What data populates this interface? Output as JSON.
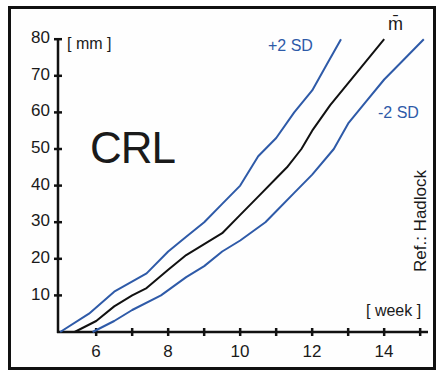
{
  "chart_data": {
    "type": "line",
    "title": "CRL",
    "xlabel": "[ week ]",
    "ylabel": "[ mm ]",
    "xlim": [
      5,
      15.2
    ],
    "ylim": [
      0,
      80
    ],
    "x_ticks": [
      6,
      8,
      10,
      12,
      14
    ],
    "x_minor_ticks": [
      7,
      9,
      11,
      13,
      15
    ],
    "y_ticks": [
      10,
      20,
      30,
      40,
      50,
      60,
      70,
      80
    ],
    "grid": false,
    "legend": "inline labels at line ends",
    "annotation": "Ref.: Hadlock",
    "series": [
      {
        "name": "+2 SD",
        "color": "#2e5aa8",
        "x": [
          5.0,
          5.8,
          6.5,
          7.4,
          8.0,
          8.5,
          9.0,
          9.5,
          10.0,
          10.5,
          11.0,
          11.5,
          12.0,
          12.4,
          12.8
        ],
        "y": [
          0,
          5,
          11,
          16,
          22,
          26,
          30,
          35,
          40,
          48,
          53,
          60,
          66,
          73,
          80
        ]
      },
      {
        "name": "m̄",
        "color": "#111111",
        "x": [
          5.4,
          6.0,
          6.5,
          7.0,
          7.4,
          8.0,
          8.5,
          9.0,
          9.5,
          10.0,
          10.5,
          11.0,
          11.3,
          11.7,
          12.0,
          12.5,
          13.0,
          13.5,
          14.0
        ],
        "y": [
          0,
          3,
          7,
          10,
          12,
          17,
          21,
          24,
          27,
          32,
          37,
          42,
          45,
          50,
          55,
          62,
          68,
          74,
          80
        ]
      },
      {
        "name": "-2 SD",
        "color": "#2e5aa8",
        "x": [
          5.9,
          6.5,
          7.0,
          7.8,
          8.5,
          9.0,
          9.5,
          10.0,
          10.7,
          11.0,
          11.5,
          12.0,
          12.6,
          13.0,
          13.5,
          14.0,
          14.5,
          15.1
        ],
        "y": [
          0,
          3,
          6,
          10,
          15,
          18,
          22,
          25,
          30,
          33,
          38,
          43,
          50,
          57,
          63,
          69,
          74,
          80
        ]
      }
    ]
  },
  "labels": {
    "title": "CRL",
    "y_unit": "[ mm ]",
    "x_unit": "[ week ]",
    "ref": "Ref.: Hadlock",
    "plus_sd": "+2 SD",
    "minus_sd": "-2 SD",
    "mean": "m̄",
    "y_tick_labels": [
      "10",
      "20",
      "30",
      "40",
      "50",
      "60",
      "70",
      "80"
    ],
    "x_tick_labels": [
      "6",
      "8",
      "10",
      "12",
      "14"
    ]
  }
}
